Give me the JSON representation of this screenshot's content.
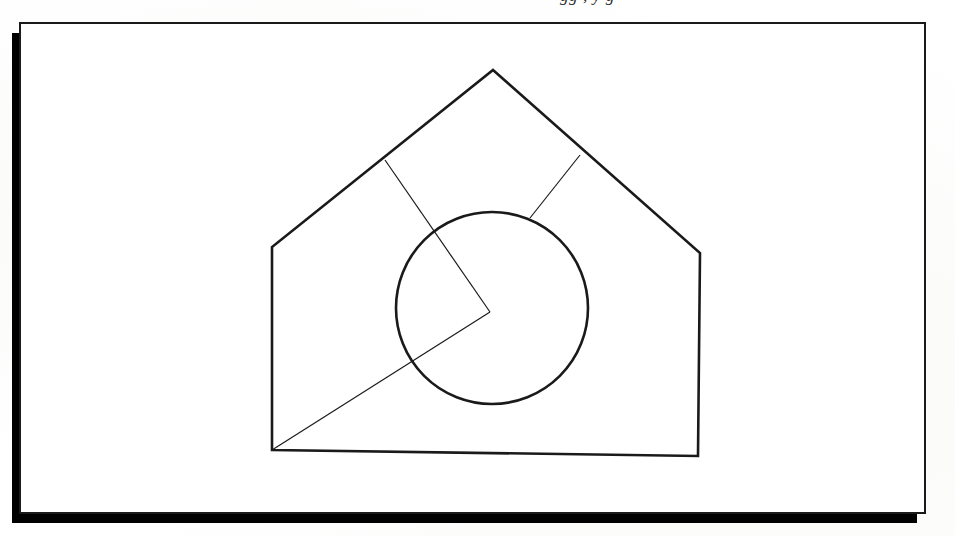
{
  "document": {
    "kind": "scanned-book-page",
    "background_color": "#ffffff",
    "page_color": "#ffffff",
    "ink_color": "#1a1a1a",
    "shadow_color": "#000000",
    "cropped_header_text": "gg , y g",
    "page_rect": {
      "x": 20,
      "y": 23,
      "width": 905,
      "height": 490
    },
    "page_border_width": 2,
    "shadow_offset_x": -8,
    "shadow_offset_y": 10,
    "shadow_width": 14
  },
  "figure": {
    "stroke_color": "#1a1a1a",
    "outline_stroke_width": 2.6,
    "construction_stroke_width": 1.2,
    "circle_stroke_width": 2.6,
    "pentagon": {
      "name": "house-pentagon",
      "points": "493,70 700,253 698,456 272,450 272,247",
      "vertices": [
        {
          "label": "apex",
          "x": 493,
          "y": 70
        },
        {
          "label": "right-shoulder",
          "x": 700,
          "y": 253
        },
        {
          "label": "bottom-right",
          "x": 698,
          "y": 456
        },
        {
          "label": "bottom-left",
          "x": 272,
          "y": 450
        },
        {
          "label": "left-shoulder",
          "x": 272,
          "y": 247
        }
      ]
    },
    "circle": {
      "name": "inscribed-circle",
      "cx": 492,
      "cy": 308,
      "r": 96
    },
    "segments": [
      {
        "name": "left-roof-to-vertex",
        "x1": 385,
        "y1": 160,
        "x2": 490,
        "y2": 312
      },
      {
        "name": "bottom-left-to-vertex",
        "x1": 272,
        "y1": 450,
        "x2": 490,
        "y2": 312
      },
      {
        "name": "right-roof-to-circle",
        "x1": 580,
        "y1": 155,
        "x2": 530,
        "y2": 218
      }
    ],
    "junction_points": [
      {
        "name": "left-roof-junction",
        "x": 385,
        "y": 160
      },
      {
        "name": "right-roof-junction",
        "x": 580,
        "y": 155
      },
      {
        "name": "chevron-apex",
        "x": 490,
        "y": 312
      }
    ]
  }
}
